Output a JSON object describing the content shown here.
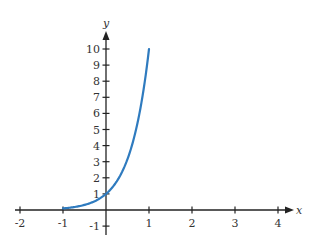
{
  "chart_data": {
    "type": "line",
    "title": "",
    "xlabel": "x",
    "ylabel": "y",
    "xlim": [
      -2,
      4
    ],
    "ylim": [
      -1,
      10
    ],
    "grid": false,
    "legend": null,
    "x_ticks": [
      -2,
      -1,
      1,
      2,
      3,
      4
    ],
    "y_ticks": [
      -1,
      1,
      2,
      3,
      4,
      5,
      6,
      7,
      8,
      9,
      10
    ],
    "series": [
      {
        "name": "y = 10^x",
        "color": "#2f7bbf",
        "function": "10^x",
        "x": [
          -1,
          -0.75,
          -0.5,
          -0.25,
          0,
          0.25,
          0.5,
          0.75,
          1
        ],
        "y": [
          0.1,
          0.18,
          0.32,
          0.56,
          1,
          1.78,
          3.16,
          5.62,
          10
        ]
      }
    ]
  },
  "colors": {
    "axis": "#222222",
    "curve": "#2f7bbf",
    "text": "#333333"
  },
  "layout": {
    "origin_px": [
      106,
      210
    ],
    "x_unit_px": 43,
    "y_unit_px": 16.1
  }
}
